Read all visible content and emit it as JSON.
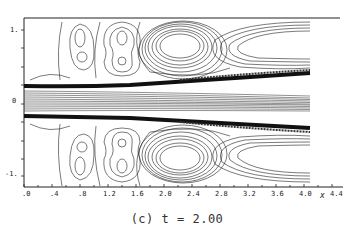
{
  "figure": {
    "caption": "(c) t = 2.00",
    "x_axis": {
      "label": "x",
      "ticks": [
        ".0",
        ".4",
        ".8",
        "1.2",
        "1.6",
        "2.0",
        "2.4",
        "2.8",
        "3.2",
        "3.6",
        "4.0",
        "4.4"
      ]
    },
    "y_axis": {
      "ticks": [
        "1.",
        "0",
        "-1."
      ]
    }
  }
}
